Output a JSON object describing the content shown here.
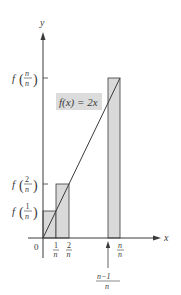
{
  "diagram": {
    "type": "riemann-sum-upper-rectangles",
    "function_label": "f(x) = 2x",
    "axes": {
      "x_label": "x",
      "y_label": "y",
      "origin_label": "0"
    },
    "x_ticks": [
      {
        "num": "1",
        "den": "n"
      },
      {
        "num": "2",
        "den": "n"
      },
      {
        "num": "n",
        "den": "n"
      }
    ],
    "x_pointer_label": {
      "num": "n−1",
      "den": "n"
    },
    "y_ticks": [
      {
        "fn": "f",
        "num": "1",
        "den": "n"
      },
      {
        "fn": "f",
        "num": "2",
        "den": "n"
      },
      {
        "fn": "f",
        "num": "n",
        "den": "n"
      }
    ],
    "colors": {
      "rect_fill": "#d9d9d9",
      "stroke": "#3a3a3a",
      "label_bg": "#dcdcdc"
    }
  }
}
